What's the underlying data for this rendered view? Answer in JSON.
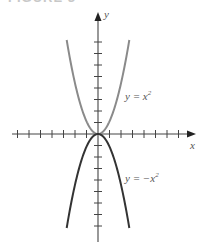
{
  "figure": {
    "caption": "FIGURE 3"
  },
  "chart_data": {
    "type": "line",
    "title": "",
    "xlabel": "x",
    "ylabel": "y",
    "grid": false,
    "legend_position": "inline labels",
    "axis_ticks": {
      "x_ticks_per_side": 7,
      "y_ticks_per_side": 8,
      "tick_labels": []
    },
    "series": [
      {
        "name": "y = x²",
        "label_text": "y = x",
        "exponent": "2",
        "function": "x^2",
        "color": "#8a8a8a",
        "x": [
          -2.7,
          -2,
          -1,
          0,
          1,
          2,
          2.7
        ],
        "y": [
          7.3,
          4,
          1,
          0,
          1,
          4,
          7.3
        ]
      },
      {
        "name": "y = −x²",
        "label_text": "y = −x",
        "exponent": "2",
        "function": "-x^2",
        "color": "#333333",
        "x": [
          -2.7,
          -2,
          -1,
          0,
          1,
          2,
          2.7
        ],
        "y": [
          -7.3,
          -4,
          -1,
          0,
          -1,
          -4,
          -7.3
        ]
      }
    ]
  },
  "labels": {
    "x_axis": "x",
    "y_axis": "y",
    "upper_curve": "y = x",
    "upper_exp": "2",
    "lower_curve": "y = −x",
    "lower_exp": "2"
  }
}
